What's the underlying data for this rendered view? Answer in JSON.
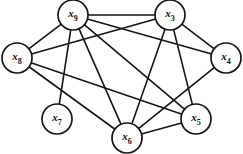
{
  "figure": {
    "type": "undirected-graph",
    "title": "",
    "background_color": "#ffffff",
    "edge_color": "#151515",
    "node_fill": "#ffffff",
    "node_stroke": "#151515",
    "node_radius": 15,
    "width": 243,
    "height": 154
  },
  "nodes": [
    {
      "id": "x9",
      "base": "x",
      "sub": "9",
      "label": "x9",
      "cx": 73,
      "cy": 15,
      "r": 15
    },
    {
      "id": "x3",
      "base": "x",
      "sub": "3",
      "label": "x3",
      "cx": 170,
      "cy": 15,
      "r": 15
    },
    {
      "id": "x8",
      "base": "x",
      "sub": "8",
      "label": "x8",
      "cx": 17,
      "cy": 58,
      "r": 15
    },
    {
      "id": "x4",
      "base": "x",
      "sub": "4",
      "label": "x4",
      "cx": 226,
      "cy": 58,
      "r": 15
    },
    {
      "id": "x7",
      "base": "x",
      "sub": "7",
      "label": "x7",
      "cx": 57,
      "cy": 119,
      "r": 15
    },
    {
      "id": "x6",
      "base": "x",
      "sub": "6",
      "label": "x6",
      "cx": 127,
      "cy": 138,
      "r": 15
    },
    {
      "id": "x5",
      "base": "x",
      "sub": "5",
      "label": "x5",
      "cx": 196,
      "cy": 119,
      "r": 15
    }
  ],
  "edges": [
    {
      "from": "x9",
      "to": "x3"
    },
    {
      "from": "x9",
      "to": "x8"
    },
    {
      "from": "x9",
      "to": "x7"
    },
    {
      "from": "x9",
      "to": "x6"
    },
    {
      "from": "x9",
      "to": "x5"
    },
    {
      "from": "x9",
      "to": "x4"
    },
    {
      "from": "x3",
      "to": "x8"
    },
    {
      "from": "x3",
      "to": "x6"
    },
    {
      "from": "x3",
      "to": "x5"
    },
    {
      "from": "x3",
      "to": "x4"
    },
    {
      "from": "x8",
      "to": "x6"
    },
    {
      "from": "x8",
      "to": "x5"
    },
    {
      "from": "x4",
      "to": "x6"
    },
    {
      "from": "x5",
      "to": "x6"
    }
  ]
}
